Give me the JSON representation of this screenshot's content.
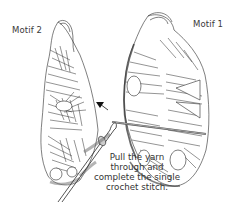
{
  "diagram": {
    "labels": {
      "left_motif": "Motif 2",
      "right_motif": "Motif 1"
    },
    "caption": {
      "line1": "Pull the yarn",
      "line2": "through and",
      "line3": "complete the single",
      "line4": "crochet stitch."
    },
    "elements": [
      "motif-2-granny-square-half",
      "motif-1-granny-square-half",
      "crochet-hook",
      "working-yarn",
      "direction-arrow"
    ],
    "colors": {
      "line": "#2a2a2a",
      "shade": "#9a9a9a",
      "background": "#ffffff",
      "text": "#333333"
    }
  }
}
